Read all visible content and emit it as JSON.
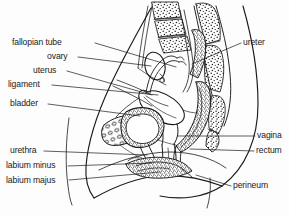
{
  "figure": {
    "type": "anatomical-diagram",
    "style": "black-and-white line drawing with stippled bone texture",
    "background_color": "#fdfdfd",
    "line_color": "#1a1a1a"
  },
  "labels": {
    "left": [
      {
        "id": "fallopian-tube",
        "text": "fallopian tube",
        "x": 12,
        "y": 38,
        "line_from_x": 95,
        "line_from_y": 43,
        "line_to_x": 176,
        "line_to_y": 67
      },
      {
        "id": "ovary",
        "text": "ovary",
        "x": 47,
        "y": 52,
        "line_from_x": 78,
        "line_from_y": 57,
        "line_to_x": 151,
        "line_to_y": 66
      },
      {
        "id": "uterus",
        "text": "uterus",
        "x": 33,
        "y": 66,
        "line_from_x": 67,
        "line_from_y": 71,
        "line_to_x": 152,
        "line_to_y": 95
      },
      {
        "id": "ligament",
        "text": "ligament",
        "x": 8,
        "y": 80,
        "line_from_x": 52,
        "line_from_y": 85,
        "line_to_x": 158,
        "line_to_y": 95
      },
      {
        "id": "bladder",
        "text": "bladder",
        "x": 10,
        "y": 99,
        "line_from_x": 48,
        "line_from_y": 104,
        "line_to_x": 140,
        "line_to_y": 116
      },
      {
        "id": "urethra",
        "text": "urethra",
        "x": 10,
        "y": 146,
        "line_from_x": 44,
        "line_from_y": 151,
        "line_to_x": 147,
        "line_to_y": 155
      },
      {
        "id": "labium-minus",
        "text": "labium minus",
        "x": 6,
        "y": 161,
        "line_from_x": 68,
        "line_from_y": 166,
        "line_to_x": 152,
        "line_to_y": 163
      },
      {
        "id": "labium-majus",
        "text": "labium majus",
        "x": 6,
        "y": 176,
        "line_from_x": 69,
        "line_from_y": 180,
        "line_to_x": 160,
        "line_to_y": 172
      }
    ],
    "right": [
      {
        "id": "ureter",
        "text": "ureter",
        "x": 243,
        "y": 38,
        "line_from_x": 241,
        "line_from_y": 43,
        "line_to_x": 192,
        "line_to_y": 64
      },
      {
        "id": "vagina",
        "text": "vagina",
        "x": 257,
        "y": 131,
        "line_from_x": 255,
        "line_from_y": 136,
        "line_to_x": 178,
        "line_to_y": 136
      },
      {
        "id": "rectum",
        "text": "rectum",
        "x": 256,
        "y": 146,
        "line_from_x": 254,
        "line_from_y": 151,
        "line_to_x": 190,
        "line_to_y": 149
      },
      {
        "id": "perineum",
        "text": "perineum",
        "x": 233,
        "y": 181,
        "line_from_x": 231,
        "line_from_y": 186,
        "line_to_x": 196,
        "line_to_y": 175
      }
    ]
  },
  "structures": [
    {
      "id": "sacrum",
      "name": "sacrum",
      "texture": "stippled-bone"
    },
    {
      "id": "vertebrae",
      "name": "lumbar vertebrae",
      "texture": "stippled-bone"
    },
    {
      "id": "coccyx",
      "name": "coccyx",
      "texture": "stippled-bone"
    },
    {
      "id": "pubic-bone",
      "name": "pubic symphysis",
      "texture": "cellular-hatch"
    },
    {
      "id": "uterus-body",
      "name": "uterus",
      "texture": "outline"
    },
    {
      "id": "ovary-body",
      "name": "ovary",
      "texture": "outline"
    },
    {
      "id": "bladder-body",
      "name": "bladder",
      "texture": "stipple-wall"
    },
    {
      "id": "rectum-body",
      "name": "rectum",
      "texture": "stipple-wall"
    },
    {
      "id": "vagina-canal",
      "name": "vagina",
      "texture": "outline"
    },
    {
      "id": "body-outline",
      "name": "abdominal wall outline",
      "texture": "outline"
    }
  ]
}
